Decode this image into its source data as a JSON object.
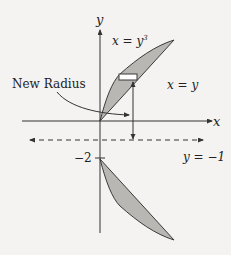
{
  "diagram": {
    "axes": {
      "x_label": "x",
      "y_label": "y"
    },
    "curves": {
      "cubic_label_prefix": "x = y",
      "cubic_label_exponent": "3",
      "linear_label": "x = y"
    },
    "annotations": {
      "new_radius": "New Radius",
      "tick_minus_two": "−2",
      "axis_of_revolution": "y = −1"
    },
    "colors": {
      "region_fill": "#b9b7b3",
      "stroke": "#3a3a3a",
      "background": "#f4f3f1"
    }
  }
}
